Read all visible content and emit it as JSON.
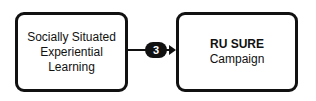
{
  "nodes": {
    "left": {
      "lines": [
        "Socially Situated",
        "Experiential",
        "Learning"
      ]
    },
    "right": {
      "title": "RU SURE",
      "subtitle": "Campaign"
    }
  },
  "edge": {
    "label": "3",
    "from": "Socially Situated Experiential Learning",
    "to": "RU SURE Campaign"
  }
}
